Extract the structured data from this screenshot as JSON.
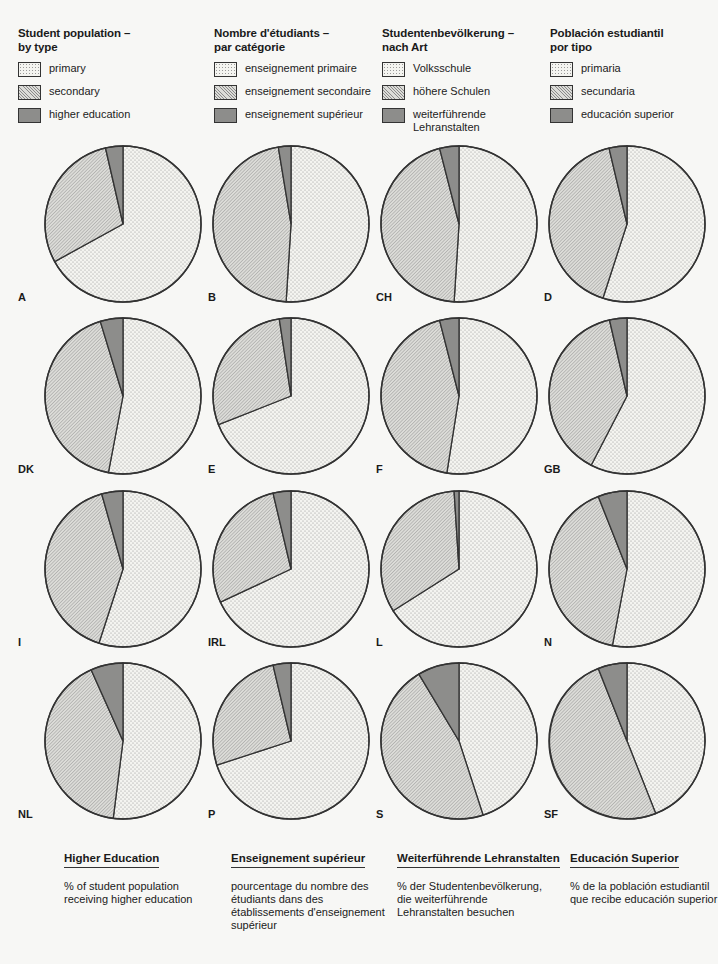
{
  "legends": [
    {
      "title": "Student population –\nby type",
      "items": [
        "primary",
        "secondary",
        "higher education"
      ]
    },
    {
      "title": "Nombre d'étudiants –\npar catégorie",
      "items": [
        "enseignement primaire",
        "enseignement secondaire",
        "enseignement supérieur"
      ]
    },
    {
      "title": "Studentenbevölkerung –\nnach Art",
      "items": [
        "Volksschule",
        "höhere Schulen",
        "weiterführende\nLehranstalten"
      ]
    },
    {
      "title": "Población estudiantil\npor tipo",
      "items": [
        "primaria",
        "secundaria",
        "educación superior"
      ]
    }
  ],
  "pies": [
    {
      "label": "A"
    },
    {
      "label": "B"
    },
    {
      "label": "CH"
    },
    {
      "label": "D"
    },
    {
      "label": "DK"
    },
    {
      "label": "E"
    },
    {
      "label": "F"
    },
    {
      "label": "GB"
    },
    {
      "label": "I"
    },
    {
      "label": "IRL"
    },
    {
      "label": "L"
    },
    {
      "label": "N"
    },
    {
      "label": "NL"
    },
    {
      "label": "P"
    },
    {
      "label": "S"
    },
    {
      "label": "SF"
    }
  ],
  "footer": [
    {
      "title": "Higher Education",
      "desc": "% of student population\n   receiving higher education"
    },
    {
      "title": "Enseignement supérieur",
      "desc": "pourcentage du nombre des\n   étudiants dans des\n   établissements d'enseignement\n   supérieur"
    },
    {
      "title": "Weiterführende Lehranstalten",
      "desc": "% der Studentenbevölkerung,\n   die weiterführende\n   Lehranstalten besuchen"
    },
    {
      "title": "Educación Superior",
      "desc": "% de la población estudiantil\n que recibe educación superior"
    }
  ],
  "colors": {
    "primary_fill": "#f4f4f0",
    "secondary_fill": "#dcdcd8",
    "higher_fill": "#8d8d8b",
    "outline": "#333333"
  },
  "chart_data": {
    "type": "pie",
    "title": "Student population – by type",
    "legend": [
      "primary",
      "secondary",
      "higher education"
    ],
    "legend_position": "top",
    "categories": [
      "A",
      "B",
      "CH",
      "D",
      "DK",
      "E",
      "F",
      "GB",
      "I",
      "IRL",
      "L",
      "N",
      "NL",
      "P",
      "S",
      "SF"
    ],
    "series": [
      {
        "name": "primary",
        "values": [
          67,
          51,
          51,
          55,
          53,
          69,
          52.5,
          57.6,
          55,
          68,
          66,
          53,
          52,
          70,
          45,
          44
        ]
      },
      {
        "name": "secondary",
        "values": [
          29.4,
          46.4,
          45,
          41.3,
          42.3,
          28.6,
          43.5,
          38.8,
          40.6,
          28.3,
          33,
          41,
          41.3,
          26.3,
          46.4,
          50
        ]
      },
      {
        "name": "higher education",
        "values": [
          3.6,
          2.6,
          4,
          3.7,
          4.7,
          2.4,
          4,
          3.6,
          4.4,
          3.7,
          1,
          6,
          6.7,
          3.7,
          8.6,
          6
        ]
      }
    ],
    "units": "% of student population",
    "start_angle": "12 o'clock, clockwise: primary, secondary, higher education"
  }
}
